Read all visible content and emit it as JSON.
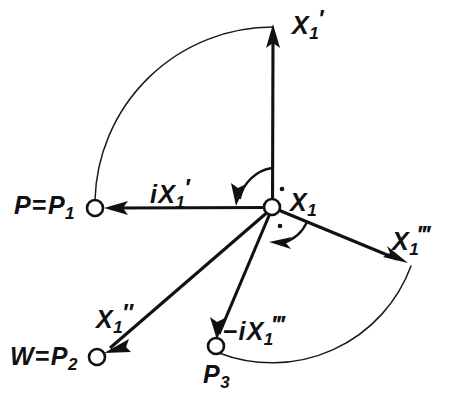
{
  "figure": {
    "type": "vector-diagram",
    "background_color": "#ffffff",
    "stroke_color": "#111111"
  },
  "labels": {
    "x1_prime": {
      "base": "X",
      "sub": "1",
      "prime": "′"
    },
    "p_equals_p1": {
      "lead": "P",
      "eq": "=",
      "base": "P",
      "sub": "1"
    },
    "i_x1_prime": {
      "imag": "i",
      "base": "X",
      "sub": "1",
      "prime": "′"
    },
    "x1": {
      "base": "X",
      "sub": "1"
    },
    "x1_triple_prime": {
      "base": "X",
      "sub": "1",
      "prime": "‴"
    },
    "x1_double_prime": {
      "base": "X",
      "sub": "1",
      "prime": "″"
    },
    "w_equals_p2": {
      "lead": "W",
      "eq": "=",
      "base": "P",
      "sub": "2"
    },
    "minus_i_x1_triple_prime": {
      "minus": "−",
      "imag": "i",
      "base": "X",
      "sub": "1",
      "prime": "‴"
    },
    "p3": {
      "base": "P",
      "sub": "3"
    }
  },
  "nodes": [
    {
      "name": "origin-node-x1",
      "id": "X1",
      "x": 272,
      "y": 207,
      "radius": 8,
      "open": true
    },
    {
      "name": "node-p1",
      "id": "P1",
      "x": 95,
      "y": 208,
      "radius": 8,
      "open": true
    },
    {
      "name": "node-p2",
      "id": "P2",
      "x": 97,
      "y": 357,
      "radius": 8,
      "open": true
    },
    {
      "name": "node-p3",
      "id": "P3",
      "x": 216,
      "y": 346,
      "radius": 8,
      "open": true
    }
  ],
  "vectors": [
    {
      "name": "vector-x1-prime",
      "label": "X1'",
      "from": [
        272,
        207
      ],
      "to": [
        273,
        27
      ],
      "direction": "up",
      "arrow_at": "to"
    },
    {
      "name": "vector-i-x1-prime",
      "label": "iX1'",
      "from": [
        272,
        207
      ],
      "to": [
        95,
        208
      ],
      "direction": "left",
      "arrow_at": "to"
    },
    {
      "name": "vector-x1-double-prime",
      "label": "X1''",
      "from": [
        272,
        207
      ],
      "to": [
        97,
        357
      ],
      "direction": "down-left",
      "arrow_at": "to"
    },
    {
      "name": "vector-minus-i-x1-triple-prime",
      "label": "-iX1'''",
      "from": [
        272,
        207
      ],
      "to": [
        216,
        346
      ],
      "direction": "down",
      "arrow_at": "to"
    },
    {
      "name": "vector-x1-triple-prime",
      "label": "X1'''",
      "from": [
        272,
        207
      ],
      "to": [
        408,
        263
      ],
      "direction": "down-right",
      "arrow_at": "to"
    }
  ],
  "arcs": [
    {
      "name": "arc-upper-quarter",
      "from": [
        273,
        27
      ],
      "to": [
        95,
        200
      ],
      "note": "quarter circle from X1' tip to P1"
    },
    {
      "name": "arc-lower",
      "from": [
        408,
        263
      ],
      "to": [
        216,
        352
      ],
      "note": "arc from X1''' tip around to P3"
    }
  ],
  "angle_markers": [
    {
      "name": "right-angle-marker-upper",
      "at": [
        272,
        207
      ],
      "between": [
        "X1'",
        "iX1'"
      ],
      "symbol": "·",
      "dot": [
        281,
        190
      ]
    },
    {
      "name": "right-angle-marker-lower",
      "at": [
        272,
        207
      ],
      "between": [
        "X1'''",
        "-iX1'''"
      ],
      "symbol": "·",
      "dot": [
        279,
        227
      ]
    }
  ]
}
